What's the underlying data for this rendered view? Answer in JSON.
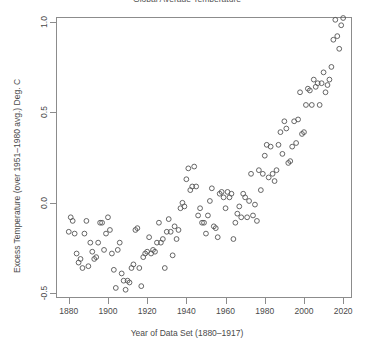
{
  "chart_data": {
    "type": "scatter",
    "title": "Global Average Temperature",
    "xlabel": "Year of Data Set (1880–1917)",
    "ylabel": "Excess Temperature (over 1951–1980 avg.) Deg. C",
    "xlim": [
      1874,
      2024
    ],
    "ylim": [
      -0.52,
      1.02
    ],
    "xticks": [
      1880,
      1900,
      1920,
      1940,
      1960,
      1980,
      2000,
      2020
    ],
    "xtick_labels": [
      "1880",
      "1900",
      "1920",
      "1940",
      "1960",
      "1980",
      "2000",
      "2020"
    ],
    "yticks": [
      -0.5,
      0.0,
      0.5,
      1.0
    ],
    "ytick_labels": [
      "-0.5",
      "0.0",
      "0.5",
      "1.0"
    ],
    "grid": false,
    "legend": null,
    "marker": "open-circle",
    "marker_color": "#555555",
    "marker_radius_px": 2.4,
    "series": [
      {
        "name": "Global temperature anomaly",
        "x": [
          1880,
          1881,
          1882,
          1883,
          1884,
          1885,
          1886,
          1887,
          1888,
          1889,
          1890,
          1891,
          1892,
          1893,
          1894,
          1895,
          1896,
          1897,
          1898,
          1899,
          1900,
          1901,
          1902,
          1903,
          1904,
          1905,
          1906,
          1907,
          1908,
          1909,
          1910,
          1911,
          1912,
          1913,
          1914,
          1915,
          1916,
          1917,
          1918,
          1919,
          1920,
          1921,
          1922,
          1923,
          1924,
          1925,
          1926,
          1927,
          1928,
          1929,
          1930,
          1931,
          1932,
          1933,
          1934,
          1935,
          1936,
          1937,
          1938,
          1939,
          1940,
          1941,
          1942,
          1943,
          1944,
          1945,
          1946,
          1947,
          1948,
          1949,
          1950,
          1951,
          1952,
          1953,
          1954,
          1955,
          1956,
          1957,
          1958,
          1959,
          1960,
          1961,
          1962,
          1963,
          1964,
          1965,
          1966,
          1967,
          1968,
          1969,
          1970,
          1971,
          1972,
          1973,
          1974,
          1975,
          1976,
          1977,
          1978,
          1979,
          1980,
          1981,
          1982,
          1983,
          1984,
          1985,
          1986,
          1987,
          1988,
          1989,
          1990,
          1991,
          1992,
          1993,
          1994,
          1995,
          1996,
          1997,
          1998,
          1999,
          2000,
          2001,
          2002,
          2003,
          2004,
          2005,
          2006,
          2007,
          2008,
          2009,
          2010,
          2011,
          2012,
          2013,
          2014,
          2015,
          2016,
          2017,
          2018,
          2019,
          2020
        ],
        "y": [
          -0.16,
          -0.08,
          -0.1,
          -0.17,
          -0.28,
          -0.33,
          -0.31,
          -0.36,
          -0.17,
          -0.1,
          -0.35,
          -0.22,
          -0.27,
          -0.31,
          -0.3,
          -0.22,
          -0.11,
          -0.11,
          -0.26,
          -0.17,
          -0.08,
          -0.15,
          -0.28,
          -0.37,
          -0.47,
          -0.26,
          -0.22,
          -0.39,
          -0.43,
          -0.48,
          -0.43,
          -0.44,
          -0.36,
          -0.34,
          -0.15,
          -0.14,
          -0.36,
          -0.46,
          -0.3,
          -0.28,
          -0.27,
          -0.19,
          -0.28,
          -0.26,
          -0.27,
          -0.22,
          -0.11,
          -0.22,
          -0.2,
          -0.36,
          -0.16,
          -0.09,
          -0.16,
          -0.29,
          -0.13,
          -0.2,
          -0.15,
          -0.03,
          0.0,
          -0.02,
          0.13,
          0.19,
          0.07,
          0.09,
          0.2,
          0.09,
          -0.07,
          -0.03,
          -0.11,
          -0.11,
          -0.17,
          -0.07,
          0.01,
          0.08,
          -0.13,
          -0.14,
          -0.19,
          0.05,
          0.06,
          0.03,
          -0.03,
          0.06,
          0.03,
          0.05,
          -0.2,
          -0.11,
          -0.06,
          -0.02,
          -0.08,
          0.05,
          0.03,
          -0.08,
          0.01,
          0.16,
          -0.07,
          -0.01,
          -0.1,
          0.18,
          0.07,
          0.16,
          0.26,
          0.32,
          0.14,
          0.31,
          0.16,
          0.12,
          0.18,
          0.32,
          0.39,
          0.27,
          0.45,
          0.41,
          0.22,
          0.23,
          0.31,
          0.45,
          0.33,
          0.46,
          0.61,
          0.38,
          0.39,
          0.54,
          0.63,
          0.62,
          0.54,
          0.68,
          0.64,
          0.66,
          0.54,
          0.66,
          0.72,
          0.61,
          0.65,
          0.68,
          0.75,
          0.9,
          1.01,
          0.92,
          0.85,
          0.98,
          1.02
        ]
      }
    ]
  }
}
